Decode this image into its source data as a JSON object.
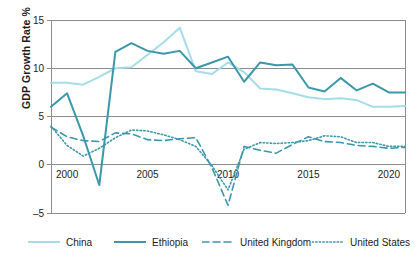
{
  "chart_data": {
    "type": "line",
    "title": "",
    "xlabel": "",
    "ylabel": "GDP Growth Rate %",
    "xlim": [
      1999,
      2021
    ],
    "ylim": [
      -5,
      15
    ],
    "grid": true,
    "grid_axis": "y",
    "legend_position": "bottom",
    "y_ticks": [
      15,
      10,
      5,
      0,
      -5
    ],
    "y_tick_labels": [
      "15",
      "10",
      "5",
      "0",
      "–5"
    ],
    "x_ticks": [
      2000,
      2005,
      2010,
      2015,
      2020
    ],
    "x_tick_labels": [
      "2000",
      "2005",
      "2010",
      "2015",
      "2020"
    ],
    "x": [
      1999,
      2000,
      2001,
      2002,
      2003,
      2004,
      2005,
      2006,
      2007,
      2008,
      2009,
      2010,
      2011,
      2012,
      2013,
      2014,
      2015,
      2016,
      2017,
      2018,
      2019,
      2020,
      2021
    ],
    "series": [
      {
        "name": "China",
        "color": "#a4dce9",
        "style": "solid",
        "values": [
          8.5,
          8.5,
          8.3,
          9.1,
          10.0,
          10.1,
          11.4,
          12.7,
          14.2,
          9.7,
          9.4,
          10.6,
          9.6,
          7.9,
          7.8,
          7.4,
          7.0,
          6.8,
          6.9,
          6.7,
          6.0,
          6.0,
          6.1
        ]
      },
      {
        "name": "Ethiopia",
        "color": "#3b97aa",
        "style": "solid",
        "values": [
          6.0,
          7.4,
          3.0,
          -2.1,
          11.7,
          12.6,
          11.8,
          11.5,
          11.8,
          10.0,
          10.6,
          11.2,
          8.6,
          10.6,
          10.3,
          10.4,
          8.0,
          7.6,
          9.0,
          7.7,
          8.4,
          7.5,
          7.5
        ]
      },
      {
        "name": "United Kingdom",
        "color": "#3b97aa",
        "style": "dashed",
        "values": [
          3.9,
          2.9,
          2.5,
          2.4,
          3.3,
          3.2,
          2.6,
          2.5,
          2.7,
          2.8,
          -0.3,
          -4.2,
          1.9,
          1.5,
          1.2,
          2.1,
          2.9,
          2.4,
          2.3,
          2.0,
          1.9,
          1.7,
          1.8
        ]
      },
      {
        "name": "United States",
        "color": "#3b97aa",
        "style": "dotted",
        "values": [
          4.0,
          2.0,
          0.9,
          1.7,
          2.8,
          3.6,
          3.5,
          3.1,
          2.6,
          1.9,
          -0.1,
          -2.6,
          1.6,
          2.3,
          2.2,
          2.3,
          2.5,
          3.0,
          2.9,
          2.3,
          2.3,
          1.9,
          1.9
        ]
      }
    ]
  },
  "axis": {
    "y_title": "GDP Growth Rate %"
  },
  "legend": {
    "items": [
      {
        "label": "China",
        "color": "#a4dce9",
        "style": "solid"
      },
      {
        "label": "Ethiopia",
        "color": "#3b97aa",
        "style": "solid"
      },
      {
        "label": "United Kingdom",
        "color": "#3b97aa",
        "style": "dashed"
      },
      {
        "label": "United States",
        "color": "#3b97aa",
        "style": "dotted"
      }
    ]
  },
  "colors": {
    "china": "#a4dce9",
    "ethiopia": "#3b97aa",
    "gridline": "#8c8c8c",
    "frame": "#8c8c8c",
    "text": "#1c1c1c"
  }
}
